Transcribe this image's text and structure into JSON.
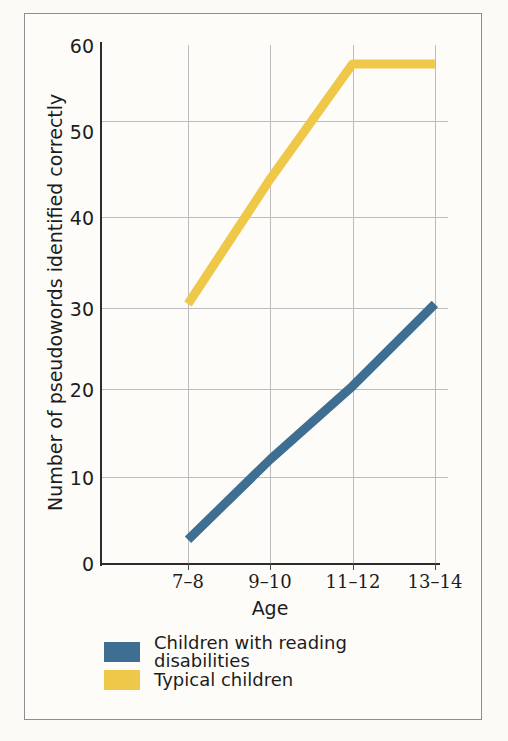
{
  "figure": {
    "background_color": "#fbfaf7",
    "frame_color": "#8e8e8e"
  },
  "chart_data": {
    "type": "line",
    "title": "",
    "xlabel": "Age",
    "ylabel": "Number of pseudowords identified correctly",
    "categories": [
      "7–8",
      "9–10",
      "11–12",
      "13–14"
    ],
    "ylim": [
      0,
      60
    ],
    "yticks": [
      0,
      10,
      20,
      30,
      40,
      50,
      60
    ],
    "ytick_labels": [
      "0",
      "10",
      "20",
      "30",
      "40",
      "50",
      "60"
    ],
    "grid": true,
    "legend_position": "below-axes",
    "series": [
      {
        "name": "Children with reading disabilities",
        "color": "#3E6F92",
        "values": [
          2.7,
          12,
          20.5,
          30
        ]
      },
      {
        "name": "Typical children",
        "color": "#EFC84A",
        "values": [
          30,
          44.5,
          57.8,
          57.8
        ]
      }
    ]
  },
  "legend": {
    "items": [
      {
        "label": "Children with reading disabilities",
        "color": "#3E6F92"
      },
      {
        "label": "Typical children",
        "color": "#EFC84A"
      }
    ]
  }
}
